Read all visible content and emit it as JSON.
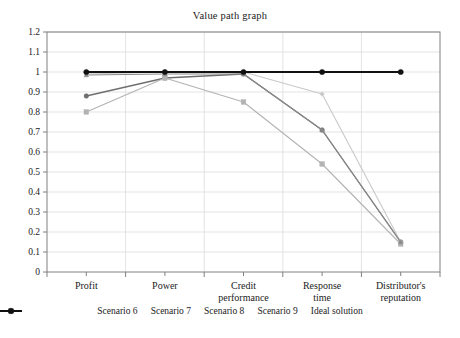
{
  "chart_data": {
    "type": "line",
    "title": "Value path graph",
    "xlabel": "",
    "ylabel": "",
    "ylim": [
      0,
      1.2
    ],
    "ytick_step": 0.1,
    "grid": true,
    "legend_position": "bottom",
    "categories": [
      "Profit",
      "Power",
      "Credit performance",
      "Response time",
      "Distributor's reputation"
    ],
    "ytick_labels": [
      "0",
      "0.1",
      "0.2",
      "0.3",
      "0.4",
      "0.5",
      "0.6",
      "0.7",
      "0.8",
      "0.9",
      "1",
      "1.1",
      "1.2"
    ],
    "ytick_values": [
      0,
      0.1,
      0.2,
      0.3,
      0.4,
      0.5,
      0.6,
      0.7,
      0.8,
      0.9,
      1.0,
      1.1,
      1.2
    ],
    "series": [
      {
        "name": "Scenario 6",
        "values": [
          0.88,
          0.97,
          0.99,
          0.71,
          0.15
        ],
        "color": "#6e6e6e",
        "marker": "circle",
        "width": 1.3
      },
      {
        "name": "Scenario 7",
        "values": [
          0.99,
          1.0,
          1.0,
          0.89,
          0.15
        ],
        "color": "#c9c9c9",
        "marker": "diamond",
        "width": 1.1
      },
      {
        "name": "Scenario 8",
        "values": [
          0.8,
          0.97,
          0.85,
          0.54,
          0.14
        ],
        "color": "#b3b3b3",
        "marker": "square",
        "width": 1.1
      },
      {
        "name": "Scenario 9",
        "values": [
          0.985,
          0.99,
          0.99,
          0.71,
          0.15
        ],
        "color": "#8a8a8a",
        "marker": "triangle",
        "width": 1.2
      },
      {
        "name": "Ideal solution",
        "values": [
          1.0,
          1.0,
          1.0,
          1.0,
          1.0
        ],
        "color": "#111111",
        "marker": "circle",
        "width": 2.0
      }
    ]
  },
  "axis": {
    "frame_color": "#808080",
    "grid_color": "#dcdcdc"
  }
}
